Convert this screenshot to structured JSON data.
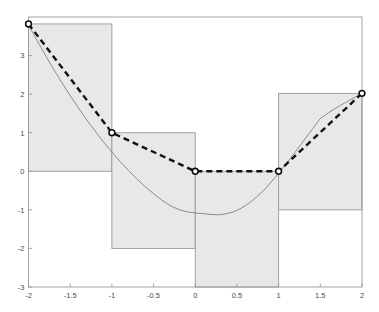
{
  "chart_data": {
    "type": "line",
    "title": "",
    "xlabel": "",
    "ylabel": "",
    "xlim": [
      -2,
      2
    ],
    "ylim": [
      -3,
      4
    ],
    "grid": false,
    "legend": null,
    "xticks": [
      -2,
      -1.5,
      -1,
      -0.5,
      0,
      0.5,
      1,
      1.5,
      2
    ],
    "xtick_labels": [
      "-2",
      "-1.5",
      "-1",
      "-0.5",
      "0",
      "0.5",
      "1",
      "1.5",
      "2"
    ],
    "yticks": [
      3,
      2,
      1,
      0,
      -1,
      -2,
      -3
    ],
    "ytick_labels": [
      "3",
      "2",
      "1",
      "0",
      "-1",
      "-2",
      "-3"
    ],
    "series": [
      {
        "name": "smooth-curve",
        "style": "solid",
        "color": "#808080",
        "points": [
          {
            "x": -2.0,
            "y": 3.8
          },
          {
            "x": -1.9,
            "y": 3.4
          },
          {
            "x": -1.8,
            "y": 3.02
          },
          {
            "x": -1.7,
            "y": 2.65
          },
          {
            "x": -1.6,
            "y": 2.3
          },
          {
            "x": -1.5,
            "y": 1.96
          },
          {
            "x": -1.4,
            "y": 1.64
          },
          {
            "x": -1.3,
            "y": 1.33
          },
          {
            "x": -1.2,
            "y": 1.04
          },
          {
            "x": -1.1,
            "y": 0.76
          },
          {
            "x": -1.0,
            "y": 0.5
          },
          {
            "x": -0.9,
            "y": 0.25
          },
          {
            "x": -0.8,
            "y": 0.02
          },
          {
            "x": -0.7,
            "y": -0.2
          },
          {
            "x": -0.6,
            "y": -0.4
          },
          {
            "x": -0.5,
            "y": -0.58
          },
          {
            "x": -0.4,
            "y": -0.75
          },
          {
            "x": -0.3,
            "y": -0.89
          },
          {
            "x": -0.2,
            "y": -0.99
          },
          {
            "x": -0.1,
            "y": -1.05
          },
          {
            "x": 0.0,
            "y": -1.08
          },
          {
            "x": 0.1,
            "y": -1.1
          },
          {
            "x": 0.2,
            "y": -1.12
          },
          {
            "x": 0.27,
            "y": -1.13
          },
          {
            "x": 0.35,
            "y": -1.11
          },
          {
            "x": 0.45,
            "y": -1.06
          },
          {
            "x": 0.55,
            "y": -0.96
          },
          {
            "x": 0.65,
            "y": -0.82
          },
          {
            "x": 0.75,
            "y": -0.64
          },
          {
            "x": 0.85,
            "y": -0.43
          },
          {
            "x": 0.95,
            "y": -0.18
          },
          {
            "x": 1.0,
            "y": -0.05
          },
          {
            "x": 1.1,
            "y": 0.22
          },
          {
            "x": 1.2,
            "y": 0.5
          },
          {
            "x": 1.3,
            "y": 0.79
          },
          {
            "x": 1.4,
            "y": 1.08
          },
          {
            "x": 1.5,
            "y": 1.37
          },
          {
            "x": 1.6,
            "y": 1.52
          },
          {
            "x": 1.7,
            "y": 1.66
          },
          {
            "x": 1.8,
            "y": 1.78
          },
          {
            "x": 1.9,
            "y": 1.9
          },
          {
            "x": 2.0,
            "y": 2.02
          }
        ]
      },
      {
        "name": "piecewise-linear-interpolant",
        "style": "dashed",
        "color": "#111111",
        "marker": "circle",
        "points": [
          {
            "x": -2,
            "y": 3.82
          },
          {
            "x": -1,
            "y": 1.0
          },
          {
            "x": 0,
            "y": 0.0
          },
          {
            "x": 1,
            "y": 0.0
          },
          {
            "x": 2,
            "y": 2.02
          }
        ]
      }
    ],
    "shaded_regions": {
      "name": "step-bars",
      "fill": "#e8e8e8",
      "edge": "#9a9a9a",
      "bars": [
        {
          "x0": -2,
          "x1": -1,
          "y0": 0,
          "y1": 3.82
        },
        {
          "x0": -1,
          "x1": 0,
          "y0": -2,
          "y1": 1.0
        },
        {
          "x0": 0,
          "x1": 1,
          "y0": -3,
          "y1": 0.0
        },
        {
          "x0": 1,
          "x1": 2,
          "y0": -1,
          "y1": 2.02
        }
      ]
    }
  },
  "axes": {
    "frame_color": "#9a9a9a",
    "background": "#ffffff"
  }
}
